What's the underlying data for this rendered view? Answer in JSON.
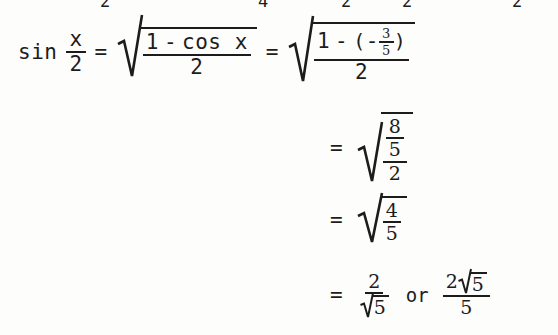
{
  "document": {
    "kind": "scanned-math-worksheet",
    "topic": "half-angle-identity-sine",
    "background_color": "#fdfdfc",
    "ink_color": "#1c1c1c"
  },
  "clipped_row": {
    "note": "partially cut-off digits from the line above",
    "digits": [
      "2",
      "4",
      "2",
      "2",
      "2"
    ]
  },
  "line1": {
    "lhs_text": "sin",
    "lhs_frac": {
      "numerator": "x",
      "denominator": "2"
    },
    "equals": "=",
    "radical1": {
      "numerator_left": "1",
      "operator": "-",
      "numerator_right": "cos x",
      "denominator": "2"
    },
    "equals2": "=",
    "radical2": {
      "numerator_left": "1",
      "operator": "-",
      "open_paren": "(",
      "inner_sign": "-",
      "inner_fraction": {
        "numerator": "3",
        "denominator": "5"
      },
      "close_paren": ")",
      "denominator": "2"
    }
  },
  "line2": {
    "equals": "=",
    "radical": {
      "numerator_fraction": {
        "numerator": "8",
        "denominator": "5"
      },
      "denominator": "2"
    }
  },
  "line3": {
    "equals": "=",
    "radical": {
      "numerator": "4",
      "denominator": "5"
    }
  },
  "line4": {
    "equals": "=",
    "result_a": {
      "numerator": "2",
      "denominator_radicand": "5"
    },
    "or_word": "or",
    "result_b": {
      "numerator_coefficient": "2",
      "numerator_radicand": "5",
      "denominator": "5"
    }
  }
}
